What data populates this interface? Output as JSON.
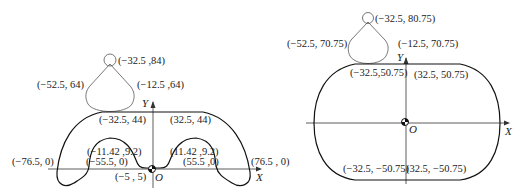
{
  "left_diagram": {
    "axes": {
      "x": "X",
      "y": "Y",
      "origin": "O"
    },
    "labels": {
      "circle_top": "(−32.5 ,84)",
      "arm_left": "(−52.5, 64)",
      "arm_right": "(−12.5 ,64)",
      "top_left": "(−32.5, 44)",
      "top_right": "(32.5, 44)",
      "outer_left": "(−76.5, 0)",
      "inner_left_top": "(−11.42 ,9.2)",
      "inner_left": "(−55.5, 0)",
      "inner_right_top": "(11.42 ,9.2)",
      "inner_right": "(55.5 ,0)",
      "outer_right": "(76.5 , 0)",
      "center": "(−5 , 5)"
    }
  },
  "right_diagram": {
    "axes": {
      "x": "X",
      "y": "Y",
      "origin": "O"
    },
    "labels": {
      "circle_top": "(−32.5, 80.75)",
      "arm_left": "(−52.5, 70.75)",
      "arm_right": "(−12.5, 70.75)",
      "top_left": "(−32.5,50.75)",
      "top_right": "(32.5, 50.75)",
      "bottom_left": "(−32.5, −50.75)",
      "bottom_right": "(32.5, −50.75)"
    }
  }
}
